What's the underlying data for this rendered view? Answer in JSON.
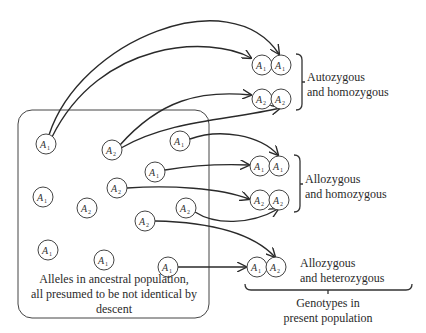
{
  "diagram": {
    "ancestral_box": {
      "caption_line1": "Alleles in ancestral population,",
      "caption_line2": "all presumed to be not identical by",
      "caption_line3": "descent",
      "alleles": [
        {
          "label": "A",
          "sub": "1",
          "x": 46,
          "y": 144
        },
        {
          "label": "A",
          "sub": "2",
          "x": 112,
          "y": 150
        },
        {
          "label": "A",
          "sub": "1",
          "x": 180,
          "y": 141
        },
        {
          "label": "A",
          "sub": "1",
          "x": 155,
          "y": 172
        },
        {
          "label": "A",
          "sub": "2",
          "x": 117,
          "y": 188
        },
        {
          "label": "A",
          "sub": "1",
          "x": 43,
          "y": 197
        },
        {
          "label": "A",
          "sub": "2",
          "x": 87,
          "y": 208
        },
        {
          "label": "A",
          "sub": "2",
          "x": 186,
          "y": 208
        },
        {
          "label": "A",
          "sub": "2",
          "x": 145,
          "y": 221
        },
        {
          "label": "A",
          "sub": "1",
          "x": 48,
          "y": 250
        },
        {
          "label": "A",
          "sub": "1",
          "x": 104,
          "y": 260
        },
        {
          "label": "A",
          "sub": "1",
          "x": 168,
          "y": 267
        }
      ]
    },
    "genotypes": [
      {
        "left": "A₁",
        "right": "A₁",
        "group": "autozygous-homozygous"
      },
      {
        "left": "A₂",
        "right": "A₂",
        "group": "autozygous-homozygous"
      },
      {
        "left": "A₁",
        "right": "A₁",
        "group": "allozygous-homozygous"
      },
      {
        "left": "A₂",
        "right": "A₂",
        "group": "allozygous-homozygous"
      },
      {
        "left": "A₁",
        "right": "A₂",
        "group": "allozygous-heterozygous"
      }
    ],
    "group_labels": {
      "autozygous_line1": "Autozygous",
      "autozygous_line2": "and homozygous",
      "allozygous_homo_line1": "Allozygous",
      "allozygous_homo_line2": "and homozygous",
      "allozygous_hetero_line1": "Allozygous",
      "allozygous_hetero_line2": "and heterozygous"
    },
    "present_population": {
      "line1": "Genotypes in",
      "line2": "present population"
    }
  }
}
